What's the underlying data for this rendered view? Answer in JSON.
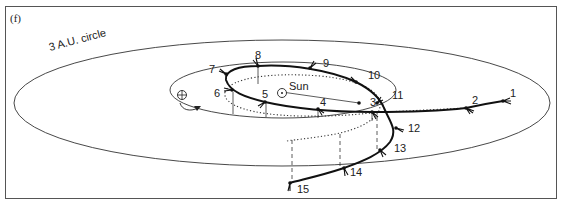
{
  "panel_label": "(f)",
  "circle_label": "3 A.U. circle",
  "sun_label": "Sun",
  "earth_symbol": "⊕",
  "sun_symbol": "⊙",
  "points": [
    {
      "n": "1",
      "x": 503,
      "y": 101
    },
    {
      "n": "2",
      "x": 466,
      "y": 108
    },
    {
      "n": "3",
      "x": 372,
      "y": 112
    },
    {
      "n": "4",
      "x": 318,
      "y": 109
    },
    {
      "n": "5",
      "x": 265,
      "y": 102
    },
    {
      "n": "6",
      "x": 232,
      "y": 90
    },
    {
      "n": "7",
      "x": 226,
      "y": 74
    },
    {
      "n": "8",
      "x": 258,
      "y": 66
    },
    {
      "n": "9",
      "x": 310,
      "y": 68
    },
    {
      "n": "10",
      "x": 356,
      "y": 82
    },
    {
      "n": "11",
      "x": 377,
      "y": 103
    },
    {
      "n": "12",
      "x": 396,
      "y": 128
    },
    {
      "n": "13",
      "x": 380,
      "y": 150
    },
    {
      "n": "14",
      "x": 344,
      "y": 168
    },
    {
      "n": "15",
      "x": 290,
      "y": 183
    }
  ],
  "colors": {
    "line": "#111111",
    "frame": "#555555"
  }
}
